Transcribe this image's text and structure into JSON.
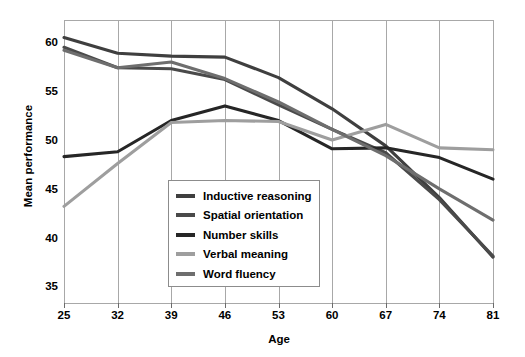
{
  "chart_data": {
    "type": "line",
    "title": "",
    "xlabel": "Age",
    "ylabel": "Mean performance",
    "x": [
      25,
      32,
      39,
      46,
      53,
      60,
      67,
      74,
      81
    ],
    "categories": [
      "25",
      "32",
      "39",
      "46",
      "53",
      "60",
      "67",
      "74",
      "81"
    ],
    "xlim": [
      25,
      81
    ],
    "ylim": [
      33.5,
      62.5
    ],
    "yticks": [
      35,
      40,
      45,
      50,
      55,
      60
    ],
    "ytick_labels": [
      "35",
      "40",
      "45",
      "50",
      "55",
      "60"
    ],
    "grid": "vertical",
    "legend_position": "center-bottom-inside",
    "series": [
      {
        "name": "Inductive reasoning",
        "color": "#3f3f3f",
        "values": [
          60.7,
          59.1,
          58.8,
          58.7,
          56.6,
          53.4,
          49.6,
          44.3,
          38.2
        ]
      },
      {
        "name": "Spatial orientation",
        "color": "#4a4a4a",
        "values": [
          59.7,
          57.6,
          57.5,
          56.4,
          53.8,
          51.3,
          48.9,
          44.1,
          38.3
        ]
      },
      {
        "name": "Number skills",
        "color": "#262626",
        "values": [
          48.5,
          49.0,
          52.2,
          53.7,
          52.2,
          49.3,
          49.4,
          48.4,
          46.2
        ]
      },
      {
        "name": "Verbal meaning",
        "color": "#9e9e9e",
        "values": [
          43.4,
          47.8,
          52.0,
          52.2,
          52.1,
          50.2,
          51.8,
          49.4,
          49.2
        ]
      },
      {
        "name": "Word fluency",
        "color": "#6e6e6e",
        "values": [
          59.4,
          57.6,
          58.2,
          56.5,
          54.1,
          51.3,
          48.6,
          45.2,
          42.0
        ]
      }
    ]
  },
  "axes": {
    "x_label": "Age",
    "y_label": "Mean performance"
  },
  "legend": {
    "items": [
      {
        "label": "Inductive reasoning"
      },
      {
        "label": "Spatial orientation"
      },
      {
        "label": "Number skills"
      },
      {
        "label": "Verbal meaning"
      },
      {
        "label": "Word fluency"
      }
    ]
  }
}
